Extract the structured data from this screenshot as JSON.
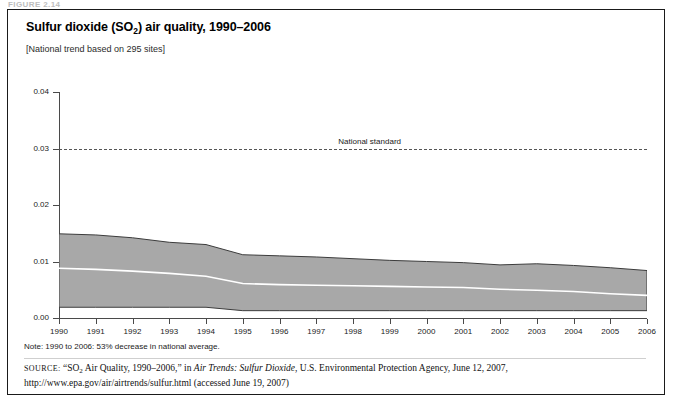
{
  "figure": {
    "label": "FIGURE 2.14"
  },
  "header": {
    "title_main": "Sulfur dioxide (SO",
    "title_sub": "2",
    "title_rest": ") air quality, 1990–2006",
    "subtitle": "[National trend based on 295 sites]"
  },
  "footer": {
    "note": "Note: 1990 to 2006: 53% decrease in national average.",
    "source_prefix": "source:",
    "source_q1": "“SO",
    "source_q1_sub": "2",
    "source_q2": " Air Quality, 1990–2006,” in ",
    "source_italic": "Air Trends: Sulfur Dioxide",
    "source_rest": ", U.S. Environmental Protection Agency, June 12, 2007, http://www.epa.gov/air/airtrends/sulfur.html (accessed June 19, 2007)"
  },
  "chart_data": {
    "type": "area",
    "title": "Sulfur dioxide (SO2) air quality, 1990–2006",
    "subtitle": "[National trend based on 295 sites]",
    "xlabel": "",
    "ylabel": "Concentration, ppm",
    "xlim": [
      1990,
      2006
    ],
    "ylim": [
      0.0,
      0.04
    ],
    "ytick_labels": [
      "0.00",
      "0.01",
      "0.02",
      "0.03",
      "0.04"
    ],
    "ytick_values": [
      0.0,
      0.01,
      0.02,
      0.03,
      0.04
    ],
    "xtick_labels": [
      "1990",
      "1991",
      "1992",
      "1993",
      "1994",
      "1995",
      "1996",
      "1997",
      "1998",
      "1999",
      "2000",
      "2001",
      "2002",
      "2003",
      "2004",
      "2005",
      "2006"
    ],
    "x": [
      1990,
      1991,
      1992,
      1993,
      1994,
      1995,
      1996,
      1997,
      1998,
      1999,
      2000,
      2001,
      2002,
      2003,
      2004,
      2005,
      2006
    ],
    "grid": false,
    "legend": "none",
    "fill_color": "#a8a8a8",
    "band_edge_color": "#3c3c3c",
    "mean_line_color": "#ffffff",
    "annotation": {
      "text": "National standard",
      "value": 0.03,
      "line_style": "dashed",
      "color": "#555555"
    },
    "series": [
      {
        "name": "90th percentile (band upper bound)",
        "values": [
          0.0149,
          0.0147,
          0.0142,
          0.0134,
          0.013,
          0.0112,
          0.011,
          0.0108,
          0.0105,
          0.0102,
          0.01,
          0.0098,
          0.0094,
          0.0096,
          0.0093,
          0.0089,
          0.0084
        ]
      },
      {
        "name": "National average (mean)",
        "values": [
          0.0088,
          0.0086,
          0.0083,
          0.0079,
          0.0074,
          0.0061,
          0.0059,
          0.0058,
          0.0057,
          0.0056,
          0.0055,
          0.0054,
          0.0051,
          0.0049,
          0.0047,
          0.0043,
          0.004
        ]
      },
      {
        "name": "10th percentile (band lower bound)",
        "values": [
          0.0019,
          0.0019,
          0.0019,
          0.0019,
          0.0019,
          0.0013,
          0.0013,
          0.0013,
          0.0013,
          0.0013,
          0.0013,
          0.0013,
          0.0013,
          0.0013,
          0.0013,
          0.0013,
          0.0013
        ]
      }
    ]
  }
}
